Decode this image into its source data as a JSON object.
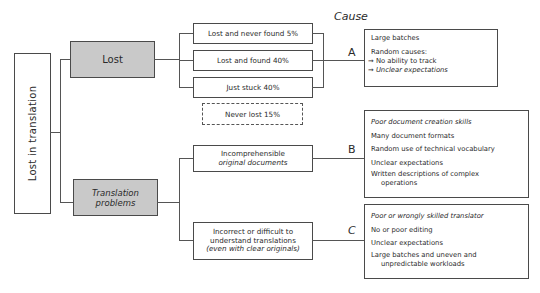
{
  "root": {
    "label": "Lost in translation"
  },
  "header": {
    "cause_label": "Cause"
  },
  "branches": [
    {
      "label": "Lost",
      "children": [
        {
          "label": "Lost and never found 5%",
          "style": "solid"
        },
        {
          "label": "Lost and found 40%",
          "style": "solid"
        },
        {
          "label": "Just stuck 40%",
          "style": "solid"
        },
        {
          "label": "Never lost 15%",
          "style": "dashed"
        }
      ],
      "cause": {
        "letter": "A",
        "items": [
          "Large batches",
          "Random causes:"
        ],
        "sub_items": [
          "No ability to track",
          "Unclear expectations"
        ]
      }
    },
    {
      "label_line1": "Translation",
      "label_line2": "problems",
      "children": [
        {
          "line1": "Incomprehensible",
          "line2": "original documents",
          "letter": "B",
          "cause_items": [
            "Poor document creation skills",
            "Many document formats",
            "Random use of technical vocabulary",
            "Unclear expectations",
            "Written descriptions of complex",
            "operations"
          ]
        },
        {
          "line1": "Incorrect or difficult to",
          "line2": "understand translations",
          "line3": "(even with clear originals)",
          "letter": "C",
          "cause_items": [
            "Poor or wrongly skilled translator",
            "No or poor editing",
            "Unclear expectations",
            "Large batches and uneven and",
            "unpredictable workloads"
          ]
        }
      ]
    }
  ],
  "arrow_glyph": "→",
  "colors": {
    "node_gray": "#c9c9c9",
    "line": "#555555",
    "border": "#4a4a4a"
  }
}
